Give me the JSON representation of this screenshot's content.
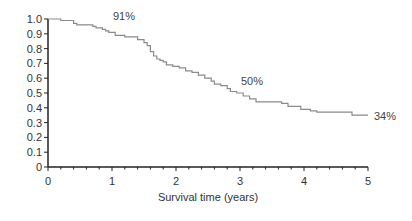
{
  "chart_data": {
    "type": "line",
    "subtype": "step",
    "title": "",
    "xlabel": "Survival time (years)",
    "ylabel": "",
    "xlim": [
      0,
      5
    ],
    "ylim": [
      0,
      1.0
    ],
    "grid": false,
    "x_ticks": [
      "0",
      "1",
      "2",
      "3",
      "4",
      "5"
    ],
    "y_ticks": [
      "0",
      "0.1",
      "0.2",
      "0.3",
      "0.4",
      "0.5",
      "0.6",
      "0.7",
      "0.8",
      "0.9",
      "1.0"
    ],
    "series": [
      {
        "name": "Survival",
        "x": [
          0,
          0.2,
          0.2,
          0.4,
          0.4,
          0.45,
          0.45,
          0.7,
          0.7,
          0.75,
          0.75,
          0.85,
          0.85,
          0.9,
          0.9,
          0.95,
          0.95,
          1.05,
          1.05,
          1.2,
          1.2,
          1.4,
          1.4,
          1.5,
          1.5,
          1.55,
          1.55,
          1.6,
          1.6,
          1.65,
          1.65,
          1.7,
          1.7,
          1.75,
          1.75,
          1.8,
          1.8,
          1.85,
          1.85,
          1.95,
          1.95,
          2.05,
          2.05,
          2.15,
          2.15,
          2.25,
          2.25,
          2.35,
          2.35,
          2.45,
          2.45,
          2.55,
          2.55,
          2.6,
          2.6,
          2.7,
          2.7,
          2.8,
          2.8,
          2.85,
          2.85,
          2.95,
          2.95,
          3.05,
          3.05,
          3.15,
          3.15,
          3.25,
          3.25,
          3.5,
          3.5,
          3.65,
          3.65,
          3.75,
          3.75,
          3.95,
          3.95,
          4.1,
          4.1,
          4.2,
          4.2,
          4.6,
          4.6,
          4.75,
          4.75,
          5.0
        ],
        "y": [
          1.0,
          1.0,
          0.99,
          0.99,
          0.97,
          0.97,
          0.96,
          0.96,
          0.95,
          0.95,
          0.94,
          0.94,
          0.93,
          0.93,
          0.92,
          0.92,
          0.91,
          0.91,
          0.89,
          0.89,
          0.88,
          0.88,
          0.86,
          0.86,
          0.84,
          0.84,
          0.82,
          0.82,
          0.78,
          0.78,
          0.75,
          0.75,
          0.73,
          0.73,
          0.72,
          0.72,
          0.71,
          0.71,
          0.69,
          0.69,
          0.68,
          0.68,
          0.67,
          0.67,
          0.65,
          0.65,
          0.64,
          0.64,
          0.62,
          0.62,
          0.6,
          0.6,
          0.58,
          0.58,
          0.56,
          0.56,
          0.55,
          0.55,
          0.53,
          0.53,
          0.51,
          0.51,
          0.5,
          0.5,
          0.48,
          0.48,
          0.46,
          0.46,
          0.44,
          0.44,
          0.44,
          0.44,
          0.43,
          0.43,
          0.41,
          0.41,
          0.39,
          0.39,
          0.38,
          0.38,
          0.37,
          0.37,
          0.37,
          0.37,
          0.35,
          0.35
        ]
      }
    ],
    "annotations": [
      {
        "text": "91%",
        "x": 1.0,
        "y": 0.91
      },
      {
        "text": "50%",
        "x": 3.0,
        "y": 0.5
      },
      {
        "text": "34%",
        "x": 5.0,
        "y": 0.34
      }
    ],
    "colors": {
      "curve": "#8a8a8a",
      "axis": "#222222",
      "text": "#333333"
    }
  }
}
